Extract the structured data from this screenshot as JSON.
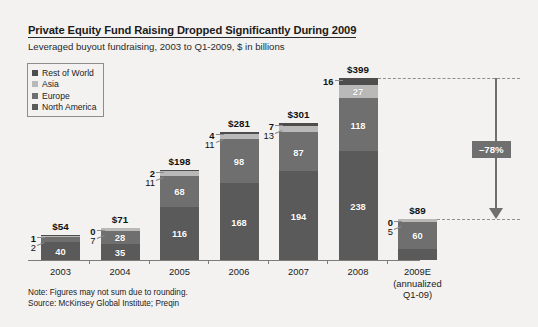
{
  "header": {
    "title": "Private Equity Fund Raising Dropped Significantly During 2009",
    "subtitle": "Leveraged buyout fundraising, 2003 to Q1-2009, $ in billions"
  },
  "legend": {
    "items": [
      {
        "label": "Rest of World",
        "color": "#4d4d4d"
      },
      {
        "label": "Asia",
        "color": "#b9b9b9"
      },
      {
        "label": "Europe",
        "color": "#6f6f6f"
      },
      {
        "label": "North America",
        "color": "#5a5a5a"
      }
    ]
  },
  "annotation": {
    "change_label": "–78%"
  },
  "footer": {
    "note": "Note: Figures may not sum due to rounding.",
    "source": "Source: McKinsey Global Institute; Preqin"
  },
  "chart_data": {
    "type": "bar",
    "title": "Private Equity Fund Raising Dropped Significantly During 2009",
    "subtitle": "Leveraged buyout fundraising, 2003 to Q1-2009, $ in billions",
    "xlabel": "",
    "ylabel": "$ in billions",
    "ylim": [
      0,
      399
    ],
    "grid": false,
    "legend_position": "top-left",
    "stacked": true,
    "categories": [
      "2003",
      "2004",
      "2005",
      "2006",
      "2007",
      "2008",
      "2009E"
    ],
    "category_sublabels": [
      "",
      "",
      "",
      "",
      "",
      "",
      "(annualized Q1-09)"
    ],
    "series": [
      {
        "name": "North America",
        "color": "#5a5a5a",
        "values": [
          40,
          35,
          116,
          168,
          194,
          238,
          24
        ]
      },
      {
        "name": "Europe",
        "color": "#6f6f6f",
        "values": [
          12,
          28,
          68,
          98,
          87,
          118,
          60
        ]
      },
      {
        "name": "Asia",
        "color": "#b9b9b9",
        "values": [
          2,
          7,
          11,
          11,
          13,
          27,
          5
        ]
      },
      {
        "name": "Rest of World",
        "color": "#4d4d4d",
        "values": [
          1,
          0,
          2,
          4,
          7,
          16,
          0
        ]
      }
    ],
    "totals": [
      "$54",
      "$71",
      "$198",
      "$281",
      "$301",
      "$399",
      "$89"
    ],
    "total_values": [
      54,
      71,
      198,
      281,
      301,
      399,
      89
    ],
    "annotations": [
      {
        "text": "–78%",
        "type": "arrow",
        "from_category": "2008",
        "to_category": "2009E"
      }
    ]
  }
}
